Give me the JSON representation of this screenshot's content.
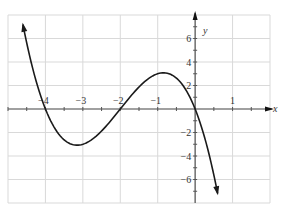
{
  "chart_data": {
    "type": "line",
    "title": "",
    "xlabel": "x",
    "ylabel": "y",
    "xlim": [
      -5,
      2
    ],
    "ylim": [
      -8,
      8
    ],
    "grid": true,
    "grid_x_step": 1,
    "grid_y_step": 2,
    "x_minor_tick_step": 0.5,
    "y_minor_tick_step": 1,
    "x_tick_labels": [
      "-4",
      "-3",
      "-2",
      "-1",
      "1"
    ],
    "x_tick_values": [
      -4,
      -3,
      -2,
      -1,
      1
    ],
    "y_tick_labels": [
      "6",
      "4",
      "2",
      "-2",
      "-4",
      "-6"
    ],
    "y_tick_values": [
      6,
      4,
      2,
      -2,
      -4,
      -6
    ],
    "series": [
      {
        "name": "f(x) = -x(x+2)(x+4)",
        "color": "#1a1a1a",
        "x_range": [
          -4.6,
          0.6
        ],
        "zeros": [
          -4,
          -2,
          0
        ],
        "local_min": [
          -3.15,
          -3.08
        ],
        "local_max": [
          -0.85,
          3.08
        ],
        "arrows_at_ends": true,
        "points": [
          [
            -4.6,
            7.18
          ],
          [
            -4.4,
            4.65
          ],
          [
            -4.2,
            2.18
          ],
          [
            -4.0,
            0
          ],
          [
            -3.8,
            -1.37
          ],
          [
            -3.6,
            -2.3
          ],
          [
            -3.4,
            -2.86
          ],
          [
            -3.15,
            -3.08
          ],
          [
            -3.0,
            -3.0
          ],
          [
            -2.8,
            -2.69
          ],
          [
            -2.6,
            -2.18
          ],
          [
            -2.4,
            -1.54
          ],
          [
            -2.2,
            -0.79
          ],
          [
            -2.0,
            0
          ],
          [
            -1.8,
            0.79
          ],
          [
            -1.6,
            1.54
          ],
          [
            -1.4,
            2.18
          ],
          [
            -1.2,
            2.69
          ],
          [
            -1.0,
            3.0
          ],
          [
            -0.85,
            3.08
          ],
          [
            -0.6,
            2.86
          ],
          [
            -0.4,
            2.3
          ],
          [
            -0.2,
            1.37
          ],
          [
            0.0,
            0
          ],
          [
            0.2,
            -1.85
          ],
          [
            0.4,
            -4.22
          ],
          [
            0.6,
            -7.18
          ]
        ]
      }
    ]
  },
  "axes": {
    "x_label": "x",
    "y_label": "y"
  },
  "colors": {
    "grid": "#d9d9d9",
    "axis": "#555555",
    "curve": "#1a1a1a"
  }
}
